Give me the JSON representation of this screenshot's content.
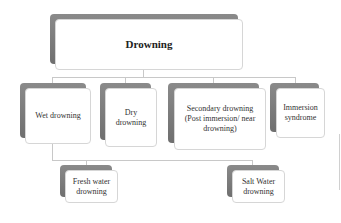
{
  "diagram": {
    "root": {
      "label": "Drowning"
    },
    "types": [
      {
        "label": "Wet drowning"
      },
      {
        "label": "Dry drowning",
        "lines": [
          "Dry",
          "drowning"
        ]
      },
      {
        "label": "Secondary drowning (Post immersion/ near drowning)",
        "lines": [
          "Secondary drowning",
          "(Post immersion/ near",
          "drowning)"
        ]
      },
      {
        "label": "Immersion syndrome",
        "lines": [
          "Immersion",
          "syndrome"
        ]
      }
    ],
    "wet_subtypes": [
      {
        "label": "Fresh water drowning",
        "lines": [
          "Fresh water",
          "drowning"
        ]
      },
      {
        "label": "Salt Water drowning",
        "lines": [
          "Salt Water",
          "drowning"
        ]
      }
    ]
  }
}
